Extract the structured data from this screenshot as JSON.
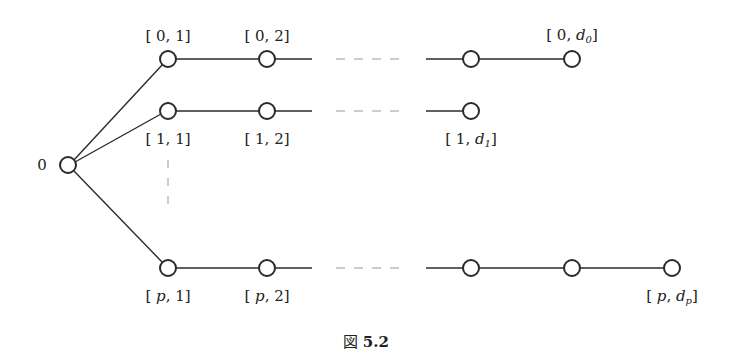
{
  "figure": {
    "caption_prefix": "図",
    "caption_number": "5.2"
  },
  "root": {
    "label": "0",
    "x": 68,
    "y": 165
  },
  "rows": [
    {
      "id": "row-0",
      "y": 59,
      "nodes_x": [
        168,
        267,
        471,
        572
      ],
      "gap": {
        "solid_end": 312,
        "dash_start": 336,
        "dash_end": 403,
        "solid_start": 426
      },
      "labels": [
        {
          "text": "[ 0, 1]",
          "x": 168,
          "pos": "above"
        },
        {
          "text": "[ 0, 2]",
          "x": 267,
          "pos": "above"
        },
        {
          "text_main": "[ 0, d",
          "text_sub": "0",
          "text_end": "]",
          "x": 572,
          "pos": "above"
        }
      ]
    },
    {
      "id": "row-1",
      "y": 111,
      "nodes_x": [
        168,
        267,
        471
      ],
      "gap": {
        "solid_end": 312,
        "dash_start": 336,
        "dash_end": 403,
        "solid_start": 426
      },
      "labels": [
        {
          "text": "[ 1, 1]",
          "x": 168,
          "pos": "below"
        },
        {
          "text": "[ 1, 2]",
          "x": 267,
          "pos": "below"
        },
        {
          "text_main": "[ 1, d",
          "text_sub": "1",
          "text_end": "]",
          "x": 471,
          "pos": "below"
        }
      ]
    },
    {
      "id": "row-p",
      "y": 268,
      "nodes_x": [
        168,
        267,
        471,
        572,
        672
      ],
      "gap": {
        "solid_end": 312,
        "dash_start": 336,
        "dash_end": 403,
        "solid_start": 426
      },
      "labels": [
        {
          "text_main": "[ p, 1]",
          "x": 168,
          "pos": "below"
        },
        {
          "text_main": "[ p, 2]",
          "x": 267,
          "pos": "below"
        },
        {
          "text_main": "[ p, d",
          "text_sub": "p",
          "text_end": "]",
          "x": 672,
          "pos": "below"
        }
      ]
    }
  ],
  "vertical_ellipsis": {
    "x": 168,
    "y1": 160,
    "y2": 205
  },
  "colors": {
    "stroke": "#2a2a2a",
    "dash": "#9a9a9a",
    "text": "#222222"
  }
}
